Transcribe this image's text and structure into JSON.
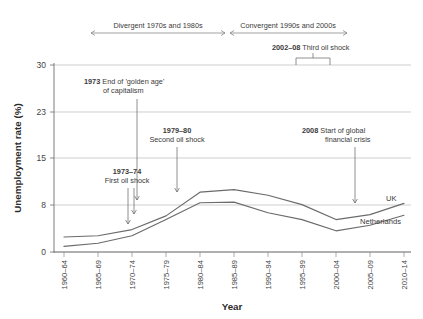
{
  "chart_data": {
    "type": "line",
    "title": "",
    "xlabel": "Year",
    "ylabel": "Unemployment rate (%)",
    "categories": [
      "1960–64",
      "1965–69",
      "1970–74",
      "1975–79",
      "1980–84",
      "1985–89",
      "1990–94",
      "1995–99",
      "2000–04",
      "2005–09",
      "2010–14"
    ],
    "yticks": [
      0,
      8,
      15,
      23,
      30
    ],
    "ylim": [
      0,
      30
    ],
    "grid": true,
    "legend_position": "inline-right",
    "series": [
      {
        "name": "UK",
        "values": [
          2.4,
          2.6,
          3.6,
          5.8,
          9.6,
          10.0,
          9.1,
          7.6,
          5.2,
          6.0,
          7.8
        ]
      },
      {
        "name": "Netherlands",
        "values": [
          0.9,
          1.4,
          2.6,
          5.2,
          7.9,
          8.0,
          6.3,
          5.2,
          3.4,
          4.3,
          5.9
        ]
      }
    ],
    "annotations": [
      {
        "id": "golden-age",
        "bold": "1973",
        "text": " End of 'golden age'",
        "line2": "of capitalism"
      },
      {
        "id": "first-oil-shock",
        "bold": "1973–74",
        "text": "",
        "line2": "First oil shock"
      },
      {
        "id": "second-oil-shock",
        "bold": "1979–80",
        "text": "",
        "line2": "Second oil shock"
      },
      {
        "id": "third-oil-shock",
        "bold": "2002–08",
        "text": " Third oil shock",
        "line2": ""
      },
      {
        "id": "financial-crisis",
        "bold": "2008",
        "text": " Start of global",
        "line2": "financial crisis"
      }
    ],
    "period_spans": [
      {
        "id": "divergent",
        "label": "Divergent 1970s and 1980s"
      },
      {
        "id": "convergent",
        "label": "Convergent 1990s and 2000s"
      }
    ]
  },
  "colors": {
    "line": "#6b6b6b",
    "grid": "#b9b9b9",
    "text": "#3c3c3c",
    "background": "#ffffff"
  }
}
